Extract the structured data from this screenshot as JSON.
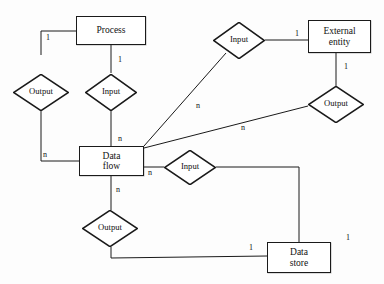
{
  "diagram": {
    "type": "entity-relationship-diagram",
    "colors": {
      "stroke": "#1a1a1a",
      "background": "#fdfdfd",
      "text": "#111111"
    },
    "entities": [
      {
        "id": "process",
        "label": "Process",
        "label_line1": "Process",
        "label_line2": "",
        "shape": "rectangle",
        "x": 76,
        "y": 16,
        "w": 70,
        "h": 29
      },
      {
        "id": "external-entity",
        "label": "External entity",
        "label_line1": "External",
        "label_line2": "entity",
        "shape": "rectangle",
        "x": 308,
        "y": 20,
        "w": 63,
        "h": 33
      },
      {
        "id": "data-flow",
        "label": "Data flow",
        "label_line1": "Data",
        "label_line2": "flow",
        "shape": "rectangle",
        "x": 79,
        "y": 146,
        "w": 65,
        "h": 30
      },
      {
        "id": "data-store",
        "label": "Data store",
        "label_line1": "Data",
        "label_line2": "store",
        "shape": "rectangle",
        "x": 267,
        "y": 242,
        "w": 64,
        "h": 31
      }
    ],
    "relationships": [
      {
        "id": "output-process-dataflow",
        "label": "Output",
        "cx": 41,
        "cy": 92,
        "w": 56,
        "h": 37
      },
      {
        "id": "input-process-dataflow",
        "label": "Input",
        "cx": 111,
        "cy": 92,
        "w": 52,
        "h": 37
      },
      {
        "id": "input-extentity-dataflow",
        "label": "Input",
        "cx": 239,
        "cy": 40,
        "w": 52,
        "h": 37
      },
      {
        "id": "output-extentity-dataflow",
        "label": "Output",
        "cx": 336,
        "cy": 104,
        "w": 56,
        "h": 37
      },
      {
        "id": "input-datastore-dataflow",
        "label": "Input",
        "cx": 190,
        "cy": 167,
        "w": 52,
        "h": 35
      },
      {
        "id": "output-dataflow-datastore",
        "label": "Output",
        "cx": 110,
        "cy": 228,
        "w": 56,
        "h": 37
      }
    ],
    "connections": [
      {
        "id": "c1",
        "from": "process",
        "to": "output-process-dataflow",
        "cardinality": "1",
        "label_x": 46,
        "label_y": 34
      },
      {
        "id": "c2",
        "from": "process",
        "to": "input-process-dataflow",
        "cardinality": "1",
        "label_x": 116,
        "label_y": 57
      },
      {
        "id": "c3",
        "from": "output-process-dataflow",
        "to": "data-flow",
        "cardinality": "n",
        "label_x": 43,
        "label_y": 152
      },
      {
        "id": "c4",
        "from": "input-process-dataflow",
        "to": "data-flow",
        "cardinality": "n",
        "label_x": 116,
        "label_y": 136
      },
      {
        "id": "c5",
        "from": "input-extentity-dataflow",
        "to": "external-entity",
        "cardinality": "1",
        "label_x": 295,
        "label_y": 31
      },
      {
        "id": "c6",
        "from": "input-extentity-dataflow",
        "to": "data-flow",
        "cardinality": "n",
        "label_x": 197,
        "label_y": 103
      },
      {
        "id": "c7",
        "from": "external-entity",
        "to": "output-extentity-dataflow",
        "cardinality": "1",
        "label_x": 344,
        "label_y": 66
      },
      {
        "id": "c8",
        "from": "output-extentity-dataflow",
        "to": "data-flow",
        "cardinality": "n",
        "label_x": 241,
        "label_y": 126
      },
      {
        "id": "c9",
        "from": "data-flow",
        "to": "input-datastore-dataflow",
        "cardinality": "n",
        "label_x": 148,
        "label_y": 170
      },
      {
        "id": "c10",
        "from": "input-datastore-dataflow",
        "to": "data-store",
        "cardinality": "1",
        "label_x": 347,
        "label_y": 238
      },
      {
        "id": "c11",
        "from": "data-flow",
        "to": "output-dataflow-datastore",
        "cardinality": "n",
        "label_x": 114,
        "label_y": 187
      },
      {
        "id": "c12",
        "from": "output-dataflow-datastore",
        "to": "data-store",
        "cardinality": "1",
        "label_x": 250,
        "label_y": 245
      }
    ],
    "cardinality_labels": [
      {
        "id": "l1",
        "text": "1",
        "x": 46,
        "y": 34
      },
      {
        "id": "l2",
        "text": "1",
        "x": 118,
        "y": 56
      },
      {
        "id": "l3",
        "text": "n",
        "x": 43,
        "y": 151
      },
      {
        "id": "l4",
        "text": "n",
        "x": 118,
        "y": 135
      },
      {
        "id": "l5",
        "text": "1",
        "x": 295,
        "y": 30
      },
      {
        "id": "l6",
        "text": "n",
        "x": 196,
        "y": 102
      },
      {
        "id": "l7",
        "text": "1",
        "x": 344,
        "y": 63
      },
      {
        "id": "l8",
        "text": "n",
        "x": 241,
        "y": 124
      },
      {
        "id": "l9",
        "text": "n",
        "x": 148,
        "y": 169
      },
      {
        "id": "l10",
        "text": "1",
        "x": 346,
        "y": 234
      },
      {
        "id": "l11",
        "text": "n",
        "x": 116,
        "y": 186
      },
      {
        "id": "l12",
        "text": "1",
        "x": 249,
        "y": 244
      }
    ],
    "edges_geometry": [
      {
        "id": "e1",
        "name": "process-to-output-left",
        "points": "41,55 41,31 76,31"
      },
      {
        "id": "e2",
        "name": "process-to-input-top",
        "points": "111,45 111,73"
      },
      {
        "id": "e3",
        "name": "output-left-to-dataflow",
        "points": "41,110 41,161 79,161"
      },
      {
        "id": "e4",
        "name": "input-top-to-dataflow",
        "points": "111,110 111,146"
      },
      {
        "id": "e5",
        "name": "input-right-to-extentity",
        "points": "265,40 308,40"
      },
      {
        "id": "e6",
        "name": "input-right-to-dataflow",
        "points": "226,53 144,146"
      },
      {
        "id": "e7",
        "name": "extentity-to-output-right",
        "points": "336,53 336,86"
      },
      {
        "id": "e8",
        "name": "output-right-to-dataflow",
        "points": "308,106 144,148"
      },
      {
        "id": "e9",
        "name": "dataflow-to-input-mid",
        "points": "144,167 164,167"
      },
      {
        "id": "e10",
        "name": "input-mid-to-datastore",
        "points": "216,167 299,167 299,242"
      },
      {
        "id": "e11",
        "name": "dataflow-to-output-bottom",
        "points": "111,176 111,210"
      },
      {
        "id": "e12",
        "name": "output-bottom-to-datastore",
        "points": "111,247 111,258 267,256"
      }
    ]
  }
}
